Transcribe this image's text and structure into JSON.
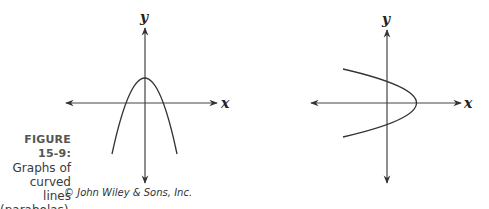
{
  "figure": {
    "label": "FIGURE 15-9:",
    "caption_lines": [
      "Graphs of",
      "curved lines",
      "(parabolas)."
    ],
    "credit": "© John Wiley & Sons, Inc."
  },
  "graphs": [
    {
      "name": "vertical-parabola",
      "x_axis_label": "x",
      "y_axis_label": "y",
      "description": "Downward-opening parabola with vertex on the positive y-axis"
    },
    {
      "name": "horizontal-parabola",
      "x_axis_label": "x",
      "y_axis_label": "y",
      "description": "Leftward-opening parabola with vertex on the positive x-axis"
    }
  ],
  "colors": {
    "axis": "#333333",
    "curve": "#333333",
    "text": "#333333"
  }
}
